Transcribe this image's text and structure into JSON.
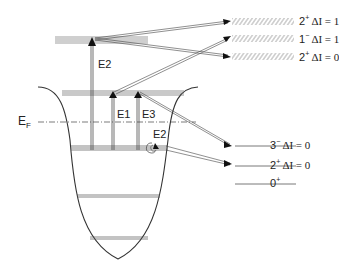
{
  "diagram": {
    "type": "nuclear-potential-well-excitation-diagram",
    "fermi_label": {
      "main": "E",
      "sub": "F"
    },
    "transition_labels": [
      {
        "id": "E2_top",
        "text": "E2"
      },
      {
        "id": "E1",
        "text": "E1"
      },
      {
        "id": "E3",
        "text": "E3"
      },
      {
        "id": "E2_low",
        "text": "E2"
      }
    ],
    "states": [
      {
        "id": "s1",
        "spin": "2",
        "parity": "+",
        "delta": "ΔI = 1",
        "style": "hatched"
      },
      {
        "id": "s2",
        "spin": "1",
        "parity": "−",
        "delta": "ΔI = 1",
        "style": "hatched"
      },
      {
        "id": "s3",
        "spin": "2",
        "parity": "+",
        "delta": "ΔI = 0",
        "style": "hatched"
      },
      {
        "id": "s4",
        "spin": "3",
        "parity": "−",
        "delta": "ΔI = 0",
        "style": "line"
      },
      {
        "id": "s5",
        "spin": "2",
        "parity": "+",
        "delta": "ΔI = 0",
        "style": "line"
      },
      {
        "id": "s6",
        "spin": "0",
        "parity": "+",
        "delta": "",
        "style": "line"
      }
    ],
    "colors": {
      "line": "#333333",
      "level": "#555555",
      "hatch": "#888888",
      "text": "#222222"
    }
  }
}
